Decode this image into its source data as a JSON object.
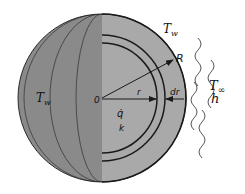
{
  "diagram": {
    "labels": {
      "wall_temp_surface": "T",
      "wall_temp_surface_sub": "w",
      "wall_temp_left": "T",
      "wall_temp_left_sub": "w",
      "radius_outer": "R",
      "radius": "r",
      "shell_thickness": "dr",
      "center": "0",
      "heat_generation": "q̇",
      "conductivity": "k",
      "ambient_temp": "T",
      "ambient_temp_sub": "∞",
      "heat_transfer_coeff": "h"
    },
    "colors": {
      "left_hemisphere": "#8a8a8a",
      "right_hemisphere": "#a9a9a9",
      "lines": "#1a1a1a"
    }
  }
}
